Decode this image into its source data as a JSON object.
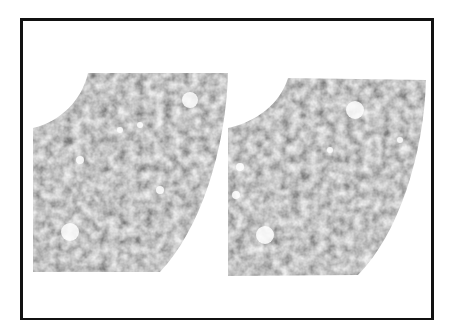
{
  "figure": {
    "type": "stereo-pair",
    "panels": [
      {
        "name": "left-panel",
        "shape": "annular-sector",
        "texture": "grayscale-mottled"
      },
      {
        "name": "right-panel",
        "shape": "annular-sector",
        "texture": "grayscale-mottled"
      }
    ],
    "colors": {
      "border": "#111111",
      "background": "#ffffff",
      "dark": "#1a1a1a",
      "mid": "#7a7a7a",
      "light": "#e8e8e8"
    }
  }
}
